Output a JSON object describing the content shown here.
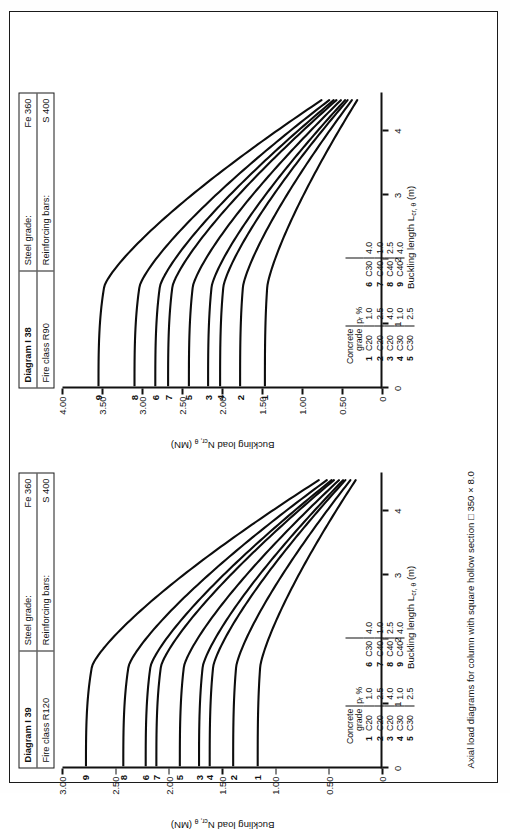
{
  "caption": "Axial load diagrams for column with square hollow section □ 350 × 8.0",
  "panels": [
    {
      "id": "I39",
      "header": {
        "diagram_label": "Diagram I 39",
        "fire_class_label": "Fire class R120",
        "steel_grade_label": "Steel grade:",
        "steel_grade_value": "Fe 360",
        "rebar_label": "Reinforcing bars:",
        "rebar_value": "S 400"
      },
      "chart_data": {
        "type": "line",
        "title": "Diagram I 39",
        "xlabel": "Buckling length L",
        "xlabel_sub": "cr, θ",
        "xlabel_unit": " (m)",
        "ylabel": "Buckling load N",
        "ylabel_sub": "cr, θ",
        "ylabel_unit": " (MN)",
        "xlim": [
          0,
          4.6
        ],
        "ylim": [
          0,
          3.0
        ],
        "xticks": [
          "0",
          "1",
          "2",
          "3",
          "4"
        ],
        "yticks": [
          "0",
          "0.50",
          "1.00",
          "1.50",
          "2.00",
          "2.50",
          "3.00"
        ],
        "grid": false,
        "legend_position": "inside-lower-left",
        "series": [
          {
            "name": "1",
            "concrete_grade": "C20",
            "pr_percent": "1.0",
            "y0": 1.17,
            "label_y": 1.17
          },
          {
            "name": "2",
            "concrete_grade": "C20",
            "pr_percent": "2.5",
            "y0": 1.4,
            "label_y": 1.4
          },
          {
            "name": "3",
            "concrete_grade": "C20",
            "pr_percent": "4.0",
            "y0": 1.72,
            "label_y": 1.72
          },
          {
            "name": "4",
            "concrete_grade": "C30",
            "pr_percent": "1.0",
            "y0": 1.62,
            "label_y": 1.62
          },
          {
            "name": "5",
            "concrete_grade": "C30",
            "pr_percent": "2.5",
            "y0": 1.9,
            "label_y": 1.9
          },
          {
            "name": "6",
            "concrete_grade": "C30",
            "pr_percent": "4.0",
            "y0": 2.22,
            "label_y": 2.22
          },
          {
            "name": "7",
            "concrete_grade": "C40",
            "pr_percent": "1.0",
            "y0": 2.12,
            "label_y": 2.12
          },
          {
            "name": "8",
            "concrete_grade": "C40",
            "pr_percent": "2.5",
            "y0": 2.43,
            "label_y": 2.43
          },
          {
            "name": "9",
            "concrete_grade": "C40",
            "pr_percent": "4.0",
            "y0": 2.78,
            "label_y": 2.78
          }
        ],
        "legend_headers": {
          "grade_line1": "Concrete",
          "grade_line2": "grade",
          "pr": "pᵣ %"
        }
      }
    },
    {
      "id": "I38",
      "header": {
        "diagram_label": "Diagram I 38",
        "fire_class_label": "Fire class R90",
        "steel_grade_label": "Steel grade:",
        "steel_grade_value": "Fe 360",
        "rebar_label": "Reinforcing bars:",
        "rebar_value": "S 400"
      },
      "chart_data": {
        "type": "line",
        "title": "Diagram I 38",
        "xlabel": "Buckling length L",
        "xlabel_sub": "cr, θ",
        "xlabel_unit": " (m)",
        "ylabel": "Buckling load N",
        "ylabel_sub": "cr, θ",
        "ylabel_unit": " (MN)",
        "xlim": [
          0,
          4.6
        ],
        "ylim": [
          0,
          4.0
        ],
        "xticks": [
          "0",
          "1",
          "2",
          "3",
          "4"
        ],
        "yticks": [
          "0",
          "0.50",
          "1.00",
          "1.50",
          "2.00",
          "2.50",
          "3.00",
          "3.50",
          "4.00"
        ],
        "grid": false,
        "legend_position": "inside-lower-left",
        "series": [
          {
            "name": "1",
            "concrete_grade": "C20",
            "pr_percent": "1.0",
            "y0": 1.47,
            "label_y": 1.47
          },
          {
            "name": "2",
            "concrete_grade": "C20",
            "pr_percent": "2.5",
            "y0": 1.78,
            "label_y": 1.78
          },
          {
            "name": "3",
            "concrete_grade": "C20",
            "pr_percent": "4.0",
            "y0": 2.18,
            "label_y": 2.18
          },
          {
            "name": "4",
            "concrete_grade": "C30",
            "pr_percent": "1.0",
            "y0": 2.03,
            "label_y": 2.03
          },
          {
            "name": "5",
            "concrete_grade": "C30",
            "pr_percent": "2.5",
            "y0": 2.42,
            "label_y": 2.42
          },
          {
            "name": "6",
            "concrete_grade": "C30",
            "pr_percent": "4.0",
            "y0": 2.84,
            "label_y": 2.84
          },
          {
            "name": "7",
            "concrete_grade": "C40",
            "pr_percent": "1.0",
            "y0": 2.68,
            "label_y": 2.68
          },
          {
            "name": "8",
            "concrete_grade": "C40",
            "pr_percent": "2.5",
            "y0": 3.1,
            "label_y": 3.1
          },
          {
            "name": "9",
            "concrete_grade": "C40",
            "pr_percent": "4.0",
            "y0": 3.55,
            "label_y": 3.55
          }
        ],
        "legend_headers": {
          "grade_line1": "Concrete",
          "grade_line2": "grade",
          "pr": "pᵣ %"
        }
      }
    }
  ]
}
